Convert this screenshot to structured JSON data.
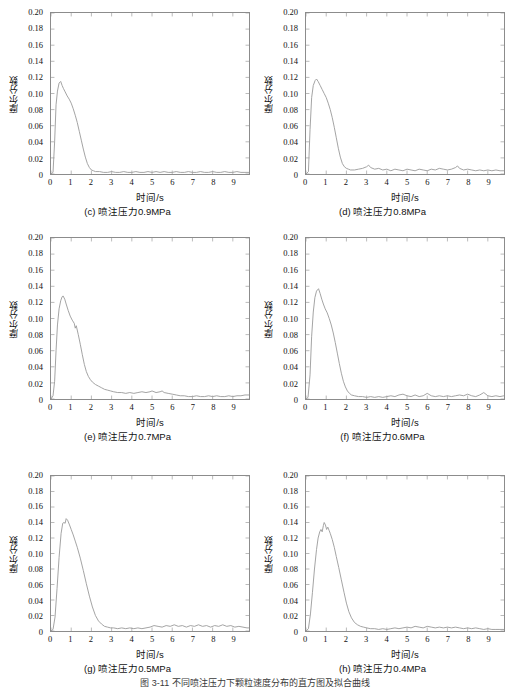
{
  "figure": {
    "caption": "图 3-11  不同喷注压力下颗粒速度分布的直方图及拟合曲线",
    "axis_titles": {
      "x": "时间/s",
      "y": "摩尔分数"
    },
    "y_ticks": [
      "0",
      "0.02",
      "0.04",
      "0.06",
      "0.08",
      "0.10",
      "0.12",
      "0.14",
      "0.16",
      "0.18",
      "0.20"
    ],
    "x_ticks": [
      "0",
      "1",
      "2",
      "3",
      "4",
      "5",
      "6",
      "7",
      "8",
      "9"
    ],
    "line_color": "#9a9a9a",
    "frame_color": "#8c8c8c"
  },
  "chart_data": [
    {
      "type": "line",
      "panel_label": "(c)",
      "caption": "(c) 喷注压力0.9MPa",
      "pressure_MPa": 0.9,
      "title": "",
      "xlabel": "时间/s",
      "ylabel": "摩尔分数",
      "xlim": [
        0,
        9.8
      ],
      "ylim": [
        0,
        0.2
      ],
      "grid": false,
      "legend": "none",
      "peak_value": 0.115,
      "peak_time": 0.42,
      "x": [
        0.0,
        0.1,
        0.18,
        0.25,
        0.32,
        0.4,
        0.48,
        0.55,
        0.62,
        0.7,
        0.8,
        0.9,
        1.0,
        1.1,
        1.2,
        1.3,
        1.4,
        1.5,
        1.6,
        1.7,
        1.8,
        1.9,
        2.0,
        2.1,
        2.2,
        2.4,
        2.6,
        2.8,
        3.0,
        3.2,
        3.4,
        3.6,
        3.8,
        4.0,
        4.2,
        4.4,
        4.6,
        4.8,
        5.0,
        5.2,
        5.4,
        5.6,
        5.8,
        6.0,
        6.2,
        6.4,
        6.6,
        6.8,
        7.0,
        7.2,
        7.4,
        7.6,
        7.8,
        8.0,
        8.2,
        8.4,
        8.6,
        8.8,
        9.0,
        9.2,
        9.4,
        9.6,
        9.8
      ],
      "y": [
        0.0,
        0.002,
        0.04,
        0.086,
        0.103,
        0.113,
        0.115,
        0.11,
        0.106,
        0.102,
        0.097,
        0.093,
        0.088,
        0.081,
        0.073,
        0.064,
        0.053,
        0.042,
        0.031,
        0.021,
        0.013,
        0.008,
        0.005,
        0.004,
        0.003,
        0.003,
        0.002,
        0.002,
        0.003,
        0.002,
        0.002,
        0.003,
        0.002,
        0.002,
        0.003,
        0.002,
        0.002,
        0.003,
        0.002,
        0.003,
        0.002,
        0.003,
        0.002,
        0.002,
        0.003,
        0.002,
        0.002,
        0.003,
        0.002,
        0.002,
        0.003,
        0.002,
        0.002,
        0.003,
        0.002,
        0.002,
        0.003,
        0.002,
        0.002,
        0.003,
        0.002,
        0.002,
        0.002
      ]
    },
    {
      "type": "line",
      "panel_label": "(d)",
      "caption": "(d) 喷注压力0.8MPa",
      "pressure_MPa": 0.8,
      "title": "",
      "xlabel": "时间/s",
      "ylabel": "摩尔分数",
      "xlim": [
        0,
        9.8
      ],
      "ylim": [
        0,
        0.2
      ],
      "grid": false,
      "legend": "none",
      "peak_value": 0.118,
      "peak_time": 0.52,
      "x": [
        0.0,
        0.12,
        0.2,
        0.28,
        0.36,
        0.45,
        0.52,
        0.6,
        0.7,
        0.8,
        0.9,
        1.0,
        1.1,
        1.2,
        1.3,
        1.4,
        1.5,
        1.6,
        1.7,
        1.8,
        1.9,
        2.0,
        2.1,
        2.2,
        2.4,
        2.6,
        2.8,
        3.0,
        3.1,
        3.2,
        3.4,
        3.6,
        3.8,
        4.0,
        4.2,
        4.4,
        4.6,
        4.8,
        5.0,
        5.2,
        5.4,
        5.6,
        5.8,
        6.0,
        6.2,
        6.4,
        6.6,
        6.8,
        7.0,
        7.2,
        7.4,
        7.5,
        7.6,
        7.8,
        8.0,
        8.2,
        8.4,
        8.6,
        8.8,
        9.0,
        9.2,
        9.4,
        9.6,
        9.8
      ],
      "y": [
        0.0,
        0.003,
        0.055,
        0.095,
        0.11,
        0.116,
        0.118,
        0.115,
        0.11,
        0.105,
        0.1,
        0.095,
        0.088,
        0.08,
        0.07,
        0.058,
        0.045,
        0.032,
        0.021,
        0.013,
        0.009,
        0.007,
        0.006,
        0.005,
        0.005,
        0.006,
        0.007,
        0.009,
        0.011,
        0.008,
        0.006,
        0.007,
        0.005,
        0.006,
        0.004,
        0.006,
        0.005,
        0.004,
        0.006,
        0.005,
        0.004,
        0.006,
        0.005,
        0.004,
        0.006,
        0.005,
        0.007,
        0.006,
        0.005,
        0.006,
        0.008,
        0.01,
        0.007,
        0.005,
        0.006,
        0.005,
        0.004,
        0.005,
        0.004,
        0.005,
        0.004,
        0.005,
        0.004,
        0.004
      ]
    },
    {
      "type": "line",
      "panel_label": "(e)",
      "caption": "(e) 喷注压力0.7MPa",
      "pressure_MPa": 0.7,
      "title": "",
      "xlabel": "时间/s",
      "ylabel": "摩尔分数",
      "xlim": [
        0,
        9.8
      ],
      "ylim": [
        0,
        0.2
      ],
      "grid": false,
      "legend": "none",
      "peak_value": 0.128,
      "peak_time": 0.58,
      "x": [
        0.0,
        0.1,
        0.18,
        0.25,
        0.32,
        0.4,
        0.48,
        0.55,
        0.6,
        0.68,
        0.75,
        0.85,
        0.95,
        1.05,
        1.15,
        1.2,
        1.25,
        1.35,
        1.45,
        1.55,
        1.65,
        1.75,
        1.85,
        1.95,
        2.05,
        2.2,
        2.35,
        2.5,
        2.65,
        2.8,
        2.95,
        3.1,
        3.3,
        3.5,
        3.7,
        3.9,
        4.1,
        4.3,
        4.5,
        4.7,
        4.9,
        5.0,
        5.2,
        5.4,
        5.5,
        5.6,
        5.8,
        6.0,
        6.2,
        6.4,
        6.6,
        6.8,
        7.0,
        7.2,
        7.4,
        7.6,
        7.8,
        8.0,
        8.2,
        8.4,
        8.6,
        8.8,
        9.0,
        9.2,
        9.4,
        9.6,
        9.8
      ],
      "y": [
        0.0,
        0.004,
        0.022,
        0.06,
        0.092,
        0.112,
        0.122,
        0.127,
        0.128,
        0.124,
        0.118,
        0.11,
        0.103,
        0.098,
        0.094,
        0.088,
        0.091,
        0.08,
        0.068,
        0.055,
        0.043,
        0.034,
        0.028,
        0.024,
        0.021,
        0.018,
        0.016,
        0.014,
        0.012,
        0.011,
        0.01,
        0.009,
        0.008,
        0.008,
        0.007,
        0.008,
        0.007,
        0.008,
        0.009,
        0.008,
        0.009,
        0.01,
        0.008,
        0.009,
        0.01,
        0.008,
        0.007,
        0.006,
        0.005,
        0.004,
        0.004,
        0.003,
        0.003,
        0.004,
        0.003,
        0.003,
        0.004,
        0.003,
        0.004,
        0.003,
        0.003,
        0.004,
        0.003,
        0.004,
        0.004,
        0.005,
        0.005
      ]
    },
    {
      "type": "line",
      "panel_label": "(f)",
      "caption": "(f) 喷注压力0.6MPa",
      "pressure_MPa": 0.6,
      "title": "",
      "xlabel": "时间/s",
      "ylabel": "摩尔分数",
      "xlim": [
        0,
        9.8
      ],
      "ylim": [
        0,
        0.2
      ],
      "grid": false,
      "legend": "none",
      "peak_value": 0.137,
      "peak_time": 0.62,
      "x": [
        0.0,
        0.1,
        0.2,
        0.28,
        0.36,
        0.44,
        0.52,
        0.58,
        0.62,
        0.7,
        0.78,
        0.86,
        0.95,
        1.05,
        1.15,
        1.25,
        1.35,
        1.45,
        1.55,
        1.65,
        1.75,
        1.85,
        1.95,
        2.05,
        2.15,
        2.25,
        2.4,
        2.6,
        2.8,
        3.0,
        3.2,
        3.4,
        3.6,
        3.8,
        4.0,
        4.2,
        4.4,
        4.6,
        4.8,
        5.0,
        5.2,
        5.4,
        5.6,
        5.8,
        6.0,
        6.2,
        6.4,
        6.6,
        6.8,
        7.0,
        7.2,
        7.4,
        7.6,
        7.8,
        8.0,
        8.2,
        8.4,
        8.6,
        8.8,
        9.0,
        9.2,
        9.4,
        9.6,
        9.8
      ],
      "y": [
        0.0,
        0.002,
        0.03,
        0.078,
        0.108,
        0.126,
        0.134,
        0.136,
        0.137,
        0.131,
        0.124,
        0.118,
        0.112,
        0.107,
        0.1,
        0.092,
        0.082,
        0.07,
        0.057,
        0.044,
        0.032,
        0.022,
        0.015,
        0.01,
        0.007,
        0.005,
        0.004,
        0.003,
        0.003,
        0.002,
        0.003,
        0.002,
        0.003,
        0.002,
        0.003,
        0.004,
        0.003,
        0.005,
        0.006,
        0.004,
        0.003,
        0.005,
        0.003,
        0.004,
        0.007,
        0.004,
        0.003,
        0.004,
        0.003,
        0.004,
        0.003,
        0.004,
        0.005,
        0.004,
        0.006,
        0.004,
        0.003,
        0.005,
        0.008,
        0.004,
        0.003,
        0.004,
        0.003,
        0.004
      ]
    },
    {
      "type": "line",
      "panel_label": "(g)",
      "caption": "(g) 喷注压力0.5MPa",
      "pressure_MPa": 0.5,
      "title": "",
      "xlabel": "时间/s",
      "ylabel": "摩尔分数",
      "xlim": [
        0,
        9.8
      ],
      "ylim": [
        0,
        0.2
      ],
      "grid": false,
      "legend": "none",
      "peak_value": 0.145,
      "peak_time": 0.75,
      "x": [
        0.0,
        0.1,
        0.2,
        0.3,
        0.4,
        0.5,
        0.58,
        0.64,
        0.7,
        0.75,
        0.82,
        0.9,
        1.0,
        1.1,
        1.2,
        1.3,
        1.45,
        1.6,
        1.75,
        1.9,
        2.05,
        2.2,
        2.35,
        2.5,
        2.65,
        2.8,
        2.95,
        3.1,
        3.3,
        3.5,
        3.7,
        3.9,
        4.1,
        4.3,
        4.5,
        4.7,
        4.9,
        5.1,
        5.3,
        5.5,
        5.7,
        5.9,
        6.1,
        6.3,
        6.5,
        6.7,
        6.9,
        7.1,
        7.3,
        7.5,
        7.7,
        7.9,
        8.1,
        8.3,
        8.5,
        8.7,
        8.9,
        9.1,
        9.3,
        9.5,
        9.7,
        9.8
      ],
      "y": [
        0.0,
        0.002,
        0.018,
        0.055,
        0.095,
        0.126,
        0.139,
        0.14,
        0.139,
        0.145,
        0.143,
        0.138,
        0.131,
        0.124,
        0.116,
        0.108,
        0.094,
        0.078,
        0.061,
        0.045,
        0.031,
        0.02,
        0.013,
        0.009,
        0.006,
        0.005,
        0.004,
        0.004,
        0.003,
        0.004,
        0.003,
        0.004,
        0.003,
        0.004,
        0.003,
        0.004,
        0.005,
        0.007,
        0.006,
        0.005,
        0.007,
        0.006,
        0.008,
        0.006,
        0.007,
        0.005,
        0.007,
        0.006,
        0.008,
        0.006,
        0.007,
        0.005,
        0.007,
        0.006,
        0.008,
        0.006,
        0.007,
        0.005,
        0.006,
        0.005,
        0.004,
        0.004
      ]
    },
    {
      "type": "line",
      "panel_label": "(h)",
      "caption": "(h) 喷注压力0.4MPa",
      "pressure_MPa": 0.4,
      "title": "",
      "xlabel": "时间/s",
      "ylabel": "摩尔分数",
      "xlim": [
        0,
        9.8
      ],
      "ylim": [
        0,
        0.2
      ],
      "grid": false,
      "legend": "none",
      "peak_value": 0.14,
      "peak_time": 0.9,
      "x": [
        0.0,
        0.12,
        0.22,
        0.32,
        0.42,
        0.52,
        0.6,
        0.68,
        0.74,
        0.8,
        0.86,
        0.9,
        0.96,
        1.02,
        1.08,
        1.14,
        1.2,
        1.3,
        1.4,
        1.5,
        1.62,
        1.75,
        1.88,
        2.0,
        2.12,
        2.25,
        2.4,
        2.55,
        2.7,
        2.85,
        3.0,
        3.2,
        3.4,
        3.6,
        3.8,
        4.0,
        4.2,
        4.4,
        4.6,
        4.8,
        5.0,
        5.2,
        5.4,
        5.6,
        5.8,
        6.0,
        6.2,
        6.4,
        6.6,
        6.8,
        7.0,
        7.2,
        7.4,
        7.6,
        7.8,
        8.0,
        8.2,
        8.4,
        8.6,
        8.8,
        9.0,
        9.2,
        9.4,
        9.6,
        9.8
      ],
      "y": [
        0.0,
        0.003,
        0.022,
        0.05,
        0.08,
        0.105,
        0.12,
        0.128,
        0.131,
        0.128,
        0.136,
        0.14,
        0.137,
        0.131,
        0.134,
        0.13,
        0.126,
        0.118,
        0.108,
        0.096,
        0.082,
        0.066,
        0.05,
        0.036,
        0.025,
        0.017,
        0.011,
        0.008,
        0.006,
        0.005,
        0.004,
        0.003,
        0.003,
        0.002,
        0.003,
        0.002,
        0.003,
        0.004,
        0.003,
        0.004,
        0.005,
        0.004,
        0.006,
        0.005,
        0.004,
        0.006,
        0.005,
        0.004,
        0.005,
        0.004,
        0.005,
        0.004,
        0.005,
        0.004,
        0.003,
        0.004,
        0.003,
        0.004,
        0.003,
        0.002,
        0.003,
        0.002,
        0.002,
        0.002,
        0.002
      ]
    }
  ]
}
